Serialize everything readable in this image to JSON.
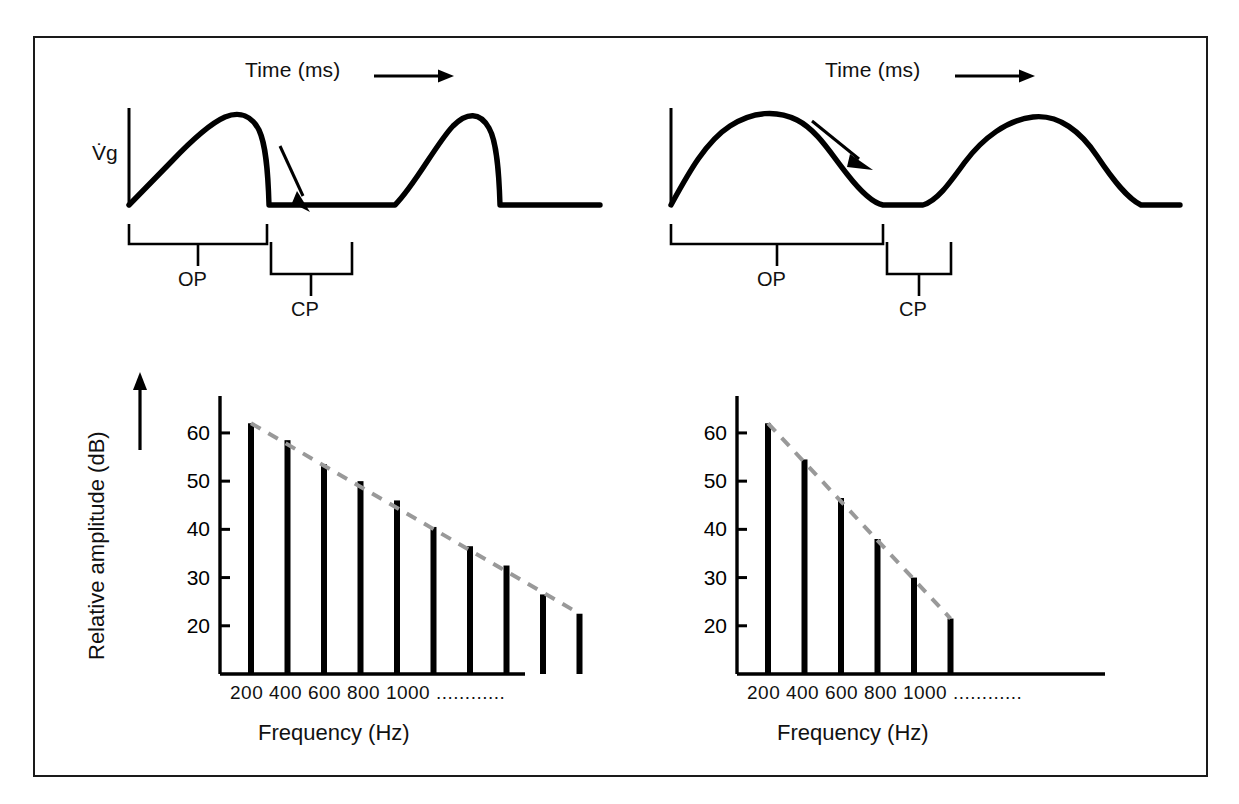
{
  "figure": {
    "border_color": "#1a1a1a",
    "background": "#ffffff",
    "ink_color": "#000000",
    "trend_color": "#999999"
  },
  "waveform_panels": [
    {
      "id": "left",
      "time_axis_label": "Time (ms)",
      "time_axis_arrow": "right-arrow-icon",
      "y_axis_label": "V̇g",
      "open_phase_label": "OP",
      "closed_phase_label": "CP",
      "closing_arrow": "steep-down-arrow-icon",
      "description": "abrupt glottal closure waveform"
    },
    {
      "id": "right",
      "time_axis_label": "Time (ms)",
      "time_axis_arrow": "right-arrow-icon",
      "y_axis_label": "",
      "open_phase_label": "OP",
      "closed_phase_label": "CP",
      "closing_arrow": "shallow-down-arrow-icon",
      "description": "gradual glottal closure waveform"
    }
  ],
  "chart_data": [
    {
      "id": "left-spectrum",
      "type": "bar",
      "title": "",
      "xlabel": "Frequency (Hz)",
      "ylabel": "Relative amplitude (dB)",
      "categories": [
        "200",
        "400",
        "600",
        "800",
        "1000",
        "",
        "",
        "",
        "",
        ""
      ],
      "tick_labels_shown": [
        "200",
        "400",
        "600",
        "800",
        "1000"
      ],
      "xtick_trailing": "............",
      "values": [
        62,
        58.5,
        53.5,
        50,
        46,
        40.5,
        36.5,
        32.5,
        26.5,
        22.5
      ],
      "yticks": [
        20,
        30,
        40,
        50,
        60
      ],
      "ylim": [
        10,
        66
      ],
      "grid": false,
      "legend": false,
      "trendline": {
        "style": "dashed",
        "color": "#999999",
        "from": [
          62,
          22.5
        ]
      }
    },
    {
      "id": "right-spectrum",
      "type": "bar",
      "title": "",
      "xlabel": "Frequency (Hz)",
      "ylabel": "",
      "categories": [
        "200",
        "400",
        "600",
        "800",
        "1000",
        ""
      ],
      "tick_labels_shown": [
        "200",
        "400",
        "600",
        "800",
        "1000"
      ],
      "xtick_trailing": "............",
      "values": [
        62,
        54.5,
        46.5,
        38,
        30,
        21.5
      ],
      "yticks": [
        20,
        30,
        40,
        50,
        60
      ],
      "ylim": [
        10,
        66
      ],
      "grid": false,
      "legend": false,
      "trendline": {
        "style": "dashed",
        "color": "#999999",
        "from": [
          62,
          21.5
        ]
      }
    }
  ]
}
